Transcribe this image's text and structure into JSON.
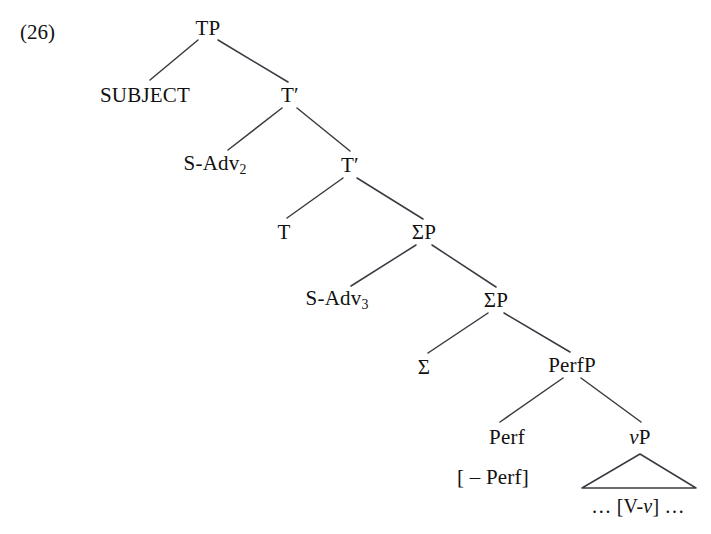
{
  "figure": {
    "example_number": "(26)",
    "background_color": "#ffffff",
    "line_color": "#3a3a42",
    "text_color": "#111111"
  },
  "tree": {
    "nodes": {
      "tp": {
        "label": "TP",
        "x": 208,
        "y": 28
      },
      "subject": {
        "label": "SUBJECT",
        "x": 145,
        "y": 95
      },
      "tbar1": {
        "label": "T′",
        "x": 290,
        "y": 95
      },
      "sadv2": {
        "label": "S-Adv",
        "subscript": "2",
        "x": 215,
        "y": 165
      },
      "tbar2": {
        "label": "T′",
        "x": 350,
        "y": 165
      },
      "t": {
        "label": "T",
        "x": 284,
        "y": 232
      },
      "sigmap1": {
        "label": "ΣP",
        "x": 424,
        "y": 232
      },
      "sadv3": {
        "label": "S-Adv",
        "subscript": "3",
        "x": 337,
        "y": 300
      },
      "sigmap2": {
        "label": "ΣP",
        "x": 496,
        "y": 300
      },
      "sigma": {
        "label": "Σ",
        "x": 424,
        "y": 367
      },
      "perfp": {
        "label": "PerfP",
        "x": 572,
        "y": 365
      },
      "perf": {
        "label": "Perf",
        "x": 507,
        "y": 437
      },
      "vp_italic": "v",
      "vp_rest": "P",
      "vp": {
        "x": 640,
        "y": 437
      },
      "perf_feature": {
        "label": "[ – Perf]",
        "x": 493,
        "y": 477
      },
      "vp_content": {
        "pre": "… [V-",
        "ital": "v",
        "post": "] …",
        "x": 638,
        "y": 506
      }
    },
    "edges": [
      {
        "name": "tp-to-subject",
        "x1": 198,
        "y1": 40,
        "x2": 150,
        "y2": 80
      },
      {
        "name": "tp-to-tbar1",
        "x1": 218,
        "y1": 40,
        "x2": 288,
        "y2": 82
      },
      {
        "name": "tbar1-to-sadv2",
        "x1": 282,
        "y1": 108,
        "x2": 228,
        "y2": 150
      },
      {
        "name": "tbar1-to-tbar2",
        "x1": 297,
        "y1": 108,
        "x2": 350,
        "y2": 151
      },
      {
        "name": "tbar2-to-t",
        "x1": 343,
        "y1": 178,
        "x2": 287,
        "y2": 218
      },
      {
        "name": "tbar2-to-sigmap1",
        "x1": 357,
        "y1": 178,
        "x2": 423,
        "y2": 219
      },
      {
        "name": "sigmap1-to-sadv3",
        "x1": 416,
        "y1": 245,
        "x2": 351,
        "y2": 286
      },
      {
        "name": "sigmap1-to-sigmap2",
        "x1": 432,
        "y1": 245,
        "x2": 496,
        "y2": 287
      },
      {
        "name": "sigmap2-to-sigma",
        "x1": 488,
        "y1": 313,
        "x2": 428,
        "y2": 353
      },
      {
        "name": "sigmap2-to-perfp",
        "x1": 504,
        "y1": 313,
        "x2": 570,
        "y2": 352
      },
      {
        "name": "perfp-to-perf",
        "x1": 563,
        "y1": 378,
        "x2": 500,
        "y2": 422
      },
      {
        "name": "perfp-to-vp",
        "x1": 581,
        "y1": 378,
        "x2": 641,
        "y2": 422
      }
    ],
    "triangle": {
      "apex_x": 640,
      "apex_y": 454,
      "left_x": 582,
      "right_x": 696,
      "base_y": 488
    }
  }
}
